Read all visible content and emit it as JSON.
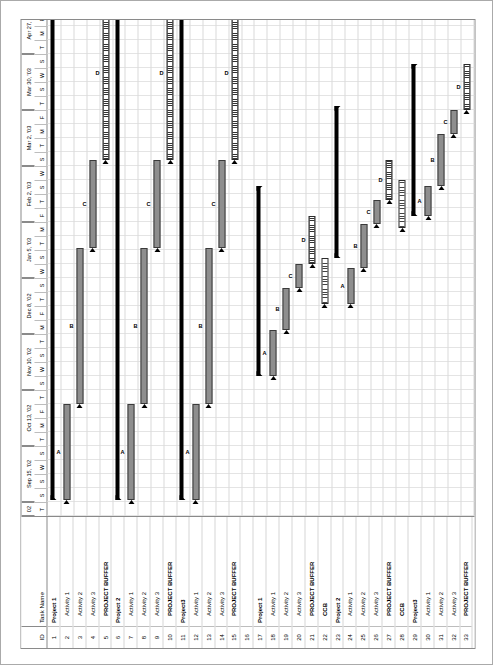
{
  "app": {
    "type": "gantt-chart",
    "orientation": "rotated-90-ccw"
  },
  "grid": {
    "header": {
      "id": "ID",
      "task_name": "Task Name"
    },
    "rows": [
      {
        "id": "1",
        "name": "Project 1",
        "level": 0
      },
      {
        "id": "2",
        "name": "Activity 1",
        "level": 1
      },
      {
        "id": "3",
        "name": "Activity 2",
        "level": 1
      },
      {
        "id": "4",
        "name": "Activity 3",
        "level": 1
      },
      {
        "id": "5",
        "name": "PROJECT BUFFER",
        "level": 1
      },
      {
        "id": "6",
        "name": "Project 2",
        "level": 0
      },
      {
        "id": "7",
        "name": "Activity 1",
        "level": 1
      },
      {
        "id": "8",
        "name": "Activity 2",
        "level": 1
      },
      {
        "id": "9",
        "name": "Activity 3",
        "level": 1
      },
      {
        "id": "10",
        "name": "PROJECT BUFFER",
        "level": 1
      },
      {
        "id": "11",
        "name": "Project3",
        "level": 0
      },
      {
        "id": "12",
        "name": "Activity 1",
        "level": 1
      },
      {
        "id": "13",
        "name": "Activity 2",
        "level": 1
      },
      {
        "id": "14",
        "name": "Activity 3",
        "level": 1
      },
      {
        "id": "15",
        "name": "PROJECT BUFFER",
        "level": 1
      },
      {
        "id": "16",
        "name": "",
        "level": 1
      },
      {
        "id": "17",
        "name": "Project 1",
        "level": 0
      },
      {
        "id": "18",
        "name": "Activity 1",
        "level": 1
      },
      {
        "id": "19",
        "name": "Activity 2",
        "level": 1
      },
      {
        "id": "20",
        "name": "Activity 3",
        "level": 1
      },
      {
        "id": "21",
        "name": "PROJECT BUFFER",
        "level": 1
      },
      {
        "id": "22",
        "name": "CCB",
        "level": 1
      },
      {
        "id": "23",
        "name": "Project 2",
        "level": 0
      },
      {
        "id": "24",
        "name": "Activity 1",
        "level": 1
      },
      {
        "id": "25",
        "name": "Activity 2",
        "level": 1
      },
      {
        "id": "26",
        "name": "Activity 3",
        "level": 1
      },
      {
        "id": "27",
        "name": "PROJECT BUFFER",
        "level": 1
      },
      {
        "id": "28",
        "name": "CCB",
        "level": 1
      },
      {
        "id": "29",
        "name": "Project3",
        "level": 0
      },
      {
        "id": "30",
        "name": "Activity 1",
        "level": 1
      },
      {
        "id": "31",
        "name": "Activity 2",
        "level": 1
      },
      {
        "id": "32",
        "name": "Activity 3",
        "level": 1
      },
      {
        "id": "33",
        "name": "PROJECT BUFFER",
        "level": 1
      }
    ]
  },
  "timescale": {
    "majors": [
      {
        "label": "02",
        "start": 0,
        "span": 14
      },
      {
        "label": "Sep 15, '02",
        "start": 14,
        "span": 56
      },
      {
        "label": "Oct 13, '02",
        "start": 70,
        "span": 56
      },
      {
        "label": "Nov 10, '02",
        "start": 126,
        "span": 56
      },
      {
        "label": "Dec 8, '02",
        "start": 182,
        "span": 56
      },
      {
        "label": "Jan 5, '03",
        "start": 238,
        "span": 56
      },
      {
        "label": "Feb 2, '03",
        "start": 294,
        "span": 56
      },
      {
        "label": "Mar 2, '03",
        "start": 350,
        "span": 56
      },
      {
        "label": "Mar 30, '03",
        "start": 406,
        "span": 56
      },
      {
        "label": "Apr 27, '03",
        "start": 462,
        "span": 56
      },
      {
        "label": "May 25, '03",
        "start": 518,
        "span": 56
      },
      {
        "label": "Ju",
        "start": 574,
        "span": 24
      }
    ],
    "minor_labels": [
      "T",
      "S",
      "S",
      "W",
      "S",
      "T",
      "M",
      "F",
      "T",
      "S",
      "W",
      "S",
      "T",
      "M",
      "F",
      "T",
      "S",
      "W",
      "S",
      "T",
      "M",
      "F",
      "T",
      "S",
      "W",
      "S",
      "T",
      "M",
      "F",
      "T",
      "S",
      "W",
      "S",
      "T",
      "M",
      "F",
      "T",
      "S",
      "W",
      "S",
      "T",
      "M",
      "F",
      "T",
      "M"
    ],
    "minor_width": 14
  },
  "chart_data": {
    "type": "bar",
    "title": "",
    "xlabel": "",
    "ylabel": "",
    "bars": [
      {
        "row": 0,
        "kind": "summary",
        "start": 16,
        "end": 530,
        "label": ""
      },
      {
        "row": 1,
        "kind": "task",
        "start": 16,
        "end": 112,
        "label": "A"
      },
      {
        "row": 2,
        "kind": "task",
        "start": 112,
        "end": 268,
        "label": "B"
      },
      {
        "row": 3,
        "kind": "task",
        "start": 268,
        "end": 356,
        "label": "C"
      },
      {
        "row": 4,
        "kind": "buffer",
        "start": 356,
        "end": 530,
        "label": "D"
      },
      {
        "row": 5,
        "kind": "summary",
        "start": 16,
        "end": 530,
        "label": ""
      },
      {
        "row": 6,
        "kind": "task",
        "start": 16,
        "end": 112,
        "label": "A"
      },
      {
        "row": 7,
        "kind": "task",
        "start": 112,
        "end": 268,
        "label": "B"
      },
      {
        "row": 8,
        "kind": "task",
        "start": 268,
        "end": 356,
        "label": "C"
      },
      {
        "row": 9,
        "kind": "buffer",
        "start": 356,
        "end": 530,
        "label": "D"
      },
      {
        "row": 10,
        "kind": "summary",
        "start": 16,
        "end": 530,
        "label": ""
      },
      {
        "row": 11,
        "kind": "task",
        "start": 16,
        "end": 112,
        "label": "A"
      },
      {
        "row": 12,
        "kind": "task",
        "start": 112,
        "end": 268,
        "label": "B"
      },
      {
        "row": 13,
        "kind": "task",
        "start": 268,
        "end": 356,
        "label": "C"
      },
      {
        "row": 14,
        "kind": "buffer",
        "start": 356,
        "end": 530,
        "label": "D"
      },
      {
        "row": 16,
        "kind": "summary",
        "start": 140,
        "end": 330,
        "label": ""
      },
      {
        "row": 17,
        "kind": "task",
        "start": 140,
        "end": 186,
        "label": "A"
      },
      {
        "row": 18,
        "kind": "task",
        "start": 186,
        "end": 228,
        "label": "B"
      },
      {
        "row": 19,
        "kind": "task",
        "start": 228,
        "end": 252,
        "label": "C"
      },
      {
        "row": 20,
        "kind": "buffer",
        "start": 252,
        "end": 300,
        "label": "D"
      },
      {
        "row": 21,
        "kind": "ccb",
        "start": 212,
        "end": 258,
        "label": ""
      },
      {
        "row": 22,
        "kind": "summary",
        "start": 258,
        "end": 410,
        "label": ""
      },
      {
        "row": 23,
        "kind": "task",
        "start": 212,
        "end": 248,
        "label": "A"
      },
      {
        "row": 24,
        "kind": "task",
        "start": 248,
        "end": 292,
        "label": "B"
      },
      {
        "row": 25,
        "kind": "task",
        "start": 292,
        "end": 316,
        "label": "C"
      },
      {
        "row": 26,
        "kind": "buffer",
        "start": 316,
        "end": 356,
        "label": "D"
      },
      {
        "row": 27,
        "kind": "ccb",
        "start": 288,
        "end": 336,
        "label": ""
      },
      {
        "row": 28,
        "kind": "summary",
        "start": 300,
        "end": 452,
        "label": ""
      },
      {
        "row": 29,
        "kind": "task",
        "start": 300,
        "end": 330,
        "label": "A"
      },
      {
        "row": 30,
        "kind": "task",
        "start": 330,
        "end": 382,
        "label": "B"
      },
      {
        "row": 31,
        "kind": "task",
        "start": 382,
        "end": 406,
        "label": "C"
      },
      {
        "row": 32,
        "kind": "buffer",
        "start": 406,
        "end": 452,
        "label": "D"
      }
    ],
    "legend": [
      {
        "key": "task",
        "name": "Activity bar",
        "color": "#8e8e8e"
      },
      {
        "key": "summary",
        "name": "Summary bar",
        "color": "#000000"
      },
      {
        "key": "buffer",
        "name": "Project buffer",
        "color": "#ffffff"
      },
      {
        "key": "ccb",
        "name": "CCB bar",
        "color": "#ffffff"
      }
    ]
  }
}
